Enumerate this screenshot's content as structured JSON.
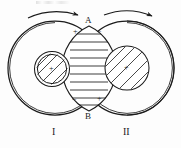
{
  "figure": {
    "background_color": "#fdfdfd",
    "stroke_color": "#1b1b1b",
    "labels": {
      "node_top": "A",
      "node_bottom": "B",
      "coil_left": "I",
      "coil_right": "II"
    },
    "polarity_marks": {
      "top_left": "+",
      "top_right": "−",
      "bottom_left": "−",
      "bottom_right": "+",
      "core_left": "+",
      "core_right": "+"
    },
    "arrows": {
      "left_label": "clockwise-current-arrow-left",
      "right_label": "clockwise-current-arrow-right"
    },
    "geometry": {
      "left_circle": {
        "cx": 55,
        "cy": 68,
        "r": 47
      },
      "right_circle": {
        "cx": 127,
        "cy": 68,
        "r": 47
      },
      "left_core": {
        "cx": 52,
        "cy": 69,
        "r": 17
      },
      "right_core": {
        "cx": 127,
        "cy": 68,
        "r": 22
      },
      "lens_top": {
        "x": 89,
        "y": 26
      },
      "lens_bottom": {
        "x": 89,
        "y": 111
      }
    },
    "hatching": {
      "lens_lines": 10,
      "lens_direction": "horizontal",
      "core_direction": "diagonal"
    }
  }
}
